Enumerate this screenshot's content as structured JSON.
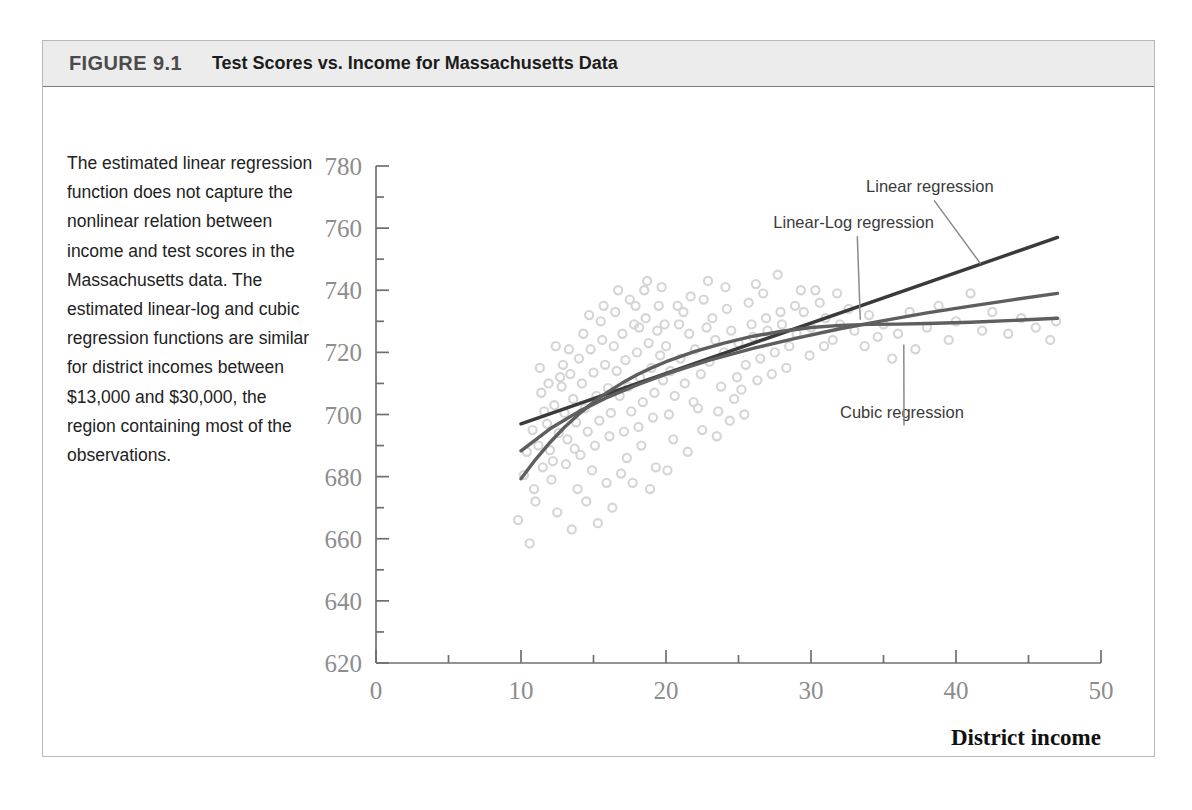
{
  "figure": {
    "number": "FIGURE 9.1",
    "title": "Test Scores vs. Income for Massachusetts Data",
    "caption": "The estimated linear regression function does not capture the nonlinear relation between income and test scores in the Massachusetts data. The estimated linear-log and cubic regression functions are similar for district incomes between $13,000 and $30,000, the region containing most of the observations."
  },
  "colors": {
    "header_band": "#ececec",
    "frame_border": "#b9b9b9",
    "scatter_point": "#d5d5d5",
    "linear_curve": "#3a3a3a",
    "linearlog_curve": "#5e5e5e",
    "cubic_curve": "#5e5e5e",
    "axis": "#6f6f6f",
    "tick_label": "#8d8d8d",
    "annotation": "#3a3a3a"
  },
  "chart_data": {
    "type": "scatter",
    "title": "Test Scores vs. Income for Massachusetts Data",
    "xlabel": "District income",
    "xlabel_sub": "(Thousands of dollars)",
    "ylabel": "",
    "xlim": [
      0,
      50
    ],
    "ylim": [
      620,
      780
    ],
    "grid": false,
    "legend_position": "annotations-on-plot",
    "xticks": [
      0,
      10,
      20,
      30,
      40,
      50
    ],
    "xtick_labels": [
      "0",
      "10",
      "20",
      "30",
      "40",
      "50"
    ],
    "xminor_ticks": [
      5,
      15,
      25,
      35,
      45
    ],
    "yticks": [
      620,
      640,
      660,
      680,
      700,
      720,
      740,
      760,
      780
    ],
    "ytick_labels": [
      "620",
      "640",
      "660",
      "680",
      "700",
      "720",
      "740",
      "760",
      "780"
    ],
    "yminor_ticks": [
      630,
      650,
      670,
      690,
      710,
      730,
      750,
      770
    ],
    "annotations": [
      {
        "label": "Linear regression",
        "text_x": 33.8,
        "text_y": 771.5,
        "tip_x": 41.7,
        "tip_y": 748.5
      },
      {
        "label": "Linear-Log regression",
        "text_x": 27.4,
        "text_y": 760.0,
        "tip_x": 33.4,
        "tip_y": 730.5
      },
      {
        "label": "Cubic regression",
        "text_x": 32.0,
        "text_y": 699.0,
        "tip_x": 36.4,
        "tip_y": 722.5
      }
    ],
    "series": [
      {
        "name": "Linear regression",
        "type": "line",
        "points": [
          [
            10.0,
            697.0
          ],
          [
            47.0,
            757.0
          ]
        ]
      },
      {
        "name": "Linear-Log regression",
        "type": "line",
        "points": [
          [
            10.0,
            688.3
          ],
          [
            12.0,
            695.4
          ],
          [
            14.0,
            701.0
          ],
          [
            16.0,
            705.6
          ],
          [
            18.0,
            709.5
          ],
          [
            20.0,
            713.0
          ],
          [
            23.0,
            717.5
          ],
          [
            26.0,
            721.3
          ],
          [
            29.0,
            724.6
          ],
          [
            32.0,
            727.6
          ],
          [
            35.0,
            730.2
          ],
          [
            38.0,
            732.7
          ],
          [
            41.0,
            734.9
          ],
          [
            44.0,
            737.0
          ],
          [
            47.0,
            739.0
          ]
        ]
      },
      {
        "name": "Cubic regression",
        "type": "line",
        "points": [
          [
            10.0,
            679.3
          ],
          [
            11.0,
            685.5
          ],
          [
            12.0,
            691.0
          ],
          [
            13.0,
            695.9
          ],
          [
            14.0,
            700.2
          ],
          [
            15.0,
            704.0
          ],
          [
            16.0,
            707.3
          ],
          [
            17.0,
            710.2
          ],
          [
            18.0,
            712.8
          ],
          [
            19.0,
            715.0
          ],
          [
            20.0,
            717.0
          ],
          [
            22.0,
            720.3
          ],
          [
            24.0,
            723.0
          ],
          [
            26.0,
            725.2
          ],
          [
            28.0,
            726.8
          ],
          [
            30.0,
            728.0
          ],
          [
            32.0,
            728.7
          ],
          [
            34.0,
            729.0
          ],
          [
            36.0,
            729.1
          ],
          [
            38.0,
            729.3
          ],
          [
            41.0,
            729.7
          ],
          [
            44.0,
            730.3
          ],
          [
            47.0,
            731.0
          ]
        ]
      }
    ],
    "scatter": {
      "name": "District observations",
      "marker": "open-circle",
      "points": [
        [
          9.8,
          666.0
        ],
        [
          10.6,
          658.5
        ],
        [
          10.2,
          680.5
        ],
        [
          10.9,
          676.0
        ],
        [
          11.2,
          690.0
        ],
        [
          11.5,
          683.0
        ],
        [
          11.0,
          672.0
        ],
        [
          11.8,
          697.0
        ],
        [
          12.0,
          688.5
        ],
        [
          12.3,
          703.0
        ],
        [
          12.6,
          694.0
        ],
        [
          12.1,
          679.0
        ],
        [
          12.8,
          709.0
        ],
        [
          13.0,
          700.5
        ],
        [
          13.2,
          692.0
        ],
        [
          13.4,
          713.0
        ],
        [
          13.6,
          705.0
        ],
        [
          13.8,
          697.5
        ],
        [
          13.1,
          684.0
        ],
        [
          14.0,
          718.0
        ],
        [
          14.2,
          710.0
        ],
        [
          14.4,
          702.0
        ],
        [
          14.6,
          694.5
        ],
        [
          14.8,
          721.0
        ],
        [
          14.1,
          687.0
        ],
        [
          15.0,
          713.5
        ],
        [
          15.2,
          706.0
        ],
        [
          15.4,
          698.0
        ],
        [
          15.6,
          724.0
        ],
        [
          15.8,
          716.0
        ],
        [
          15.1,
          690.0
        ],
        [
          15.5,
          730.0
        ],
        [
          16.0,
          708.5
        ],
        [
          16.2,
          700.5
        ],
        [
          16.4,
          722.0
        ],
        [
          16.6,
          714.0
        ],
        [
          16.8,
          706.0
        ],
        [
          16.1,
          693.0
        ],
        [
          16.5,
          733.0
        ],
        [
          17.0,
          726.0
        ],
        [
          17.2,
          717.5
        ],
        [
          17.4,
          709.0
        ],
        [
          17.6,
          701.0
        ],
        [
          17.8,
          729.0
        ],
        [
          17.1,
          694.5
        ],
        [
          17.5,
          737.0
        ],
        [
          18.0,
          720.0
        ],
        [
          18.2,
          712.0
        ],
        [
          18.4,
          704.0
        ],
        [
          18.6,
          731.0
        ],
        [
          18.8,
          723.0
        ],
        [
          18.1,
          696.0
        ],
        [
          18.5,
          740.0
        ],
        [
          19.0,
          715.0
        ],
        [
          19.2,
          707.0
        ],
        [
          19.4,
          727.0
        ],
        [
          19.6,
          719.0
        ],
        [
          19.8,
          711.0
        ],
        [
          19.1,
          699.0
        ],
        [
          19.5,
          735.0
        ],
        [
          20.0,
          722.0
        ],
        [
          20.3,
          714.0
        ],
        [
          20.6,
          706.0
        ],
        [
          20.9,
          729.0
        ],
        [
          20.2,
          700.0
        ],
        [
          21.0,
          718.0
        ],
        [
          21.3,
          710.0
        ],
        [
          21.6,
          726.0
        ],
        [
          21.9,
          704.0
        ],
        [
          21.2,
          733.0
        ],
        [
          22.0,
          721.0
        ],
        [
          22.4,
          713.0
        ],
        [
          22.8,
          728.0
        ],
        [
          22.2,
          702.0
        ],
        [
          22.6,
          737.0
        ],
        [
          23.0,
          717.0
        ],
        [
          23.4,
          724.0
        ],
        [
          23.8,
          709.0
        ],
        [
          23.2,
          731.0
        ],
        [
          23.6,
          701.0
        ],
        [
          24.0,
          720.0
        ],
        [
          24.5,
          727.0
        ],
        [
          24.9,
          712.0
        ],
        [
          24.2,
          734.0
        ],
        [
          24.7,
          705.0
        ],
        [
          25.0,
          723.0
        ],
        [
          25.5,
          716.0
        ],
        [
          25.9,
          729.0
        ],
        [
          25.2,
          708.0
        ],
        [
          25.7,
          736.0
        ],
        [
          26.0,
          725.0
        ],
        [
          26.5,
          718.0
        ],
        [
          26.9,
          731.0
        ],
        [
          26.3,
          711.0
        ],
        [
          26.7,
          739.0
        ],
        [
          27.0,
          727.0
        ],
        [
          27.5,
          720.0
        ],
        [
          27.9,
          733.0
        ],
        [
          27.3,
          713.0
        ],
        [
          28.0,
          729.0
        ],
        [
          28.5,
          722.0
        ],
        [
          28.9,
          735.0
        ],
        [
          28.3,
          715.0
        ],
        [
          29.0,
          726.0
        ],
        [
          29.5,
          733.0
        ],
        [
          29.9,
          719.0
        ],
        [
          29.3,
          740.0
        ],
        [
          30.0,
          728.0
        ],
        [
          30.6,
          736.0
        ],
        [
          30.9,
          722.0
        ],
        [
          31.0,
          731.0
        ],
        [
          31.5,
          724.0
        ],
        [
          31.8,
          739.0
        ],
        [
          32.0,
          729.0
        ],
        [
          32.6,
          734.0
        ],
        [
          33.0,
          727.0
        ],
        [
          33.7,
          722.0
        ],
        [
          34.0,
          732.0
        ],
        [
          34.6,
          725.0
        ],
        [
          35.0,
          729.0
        ],
        [
          35.6,
          718.0
        ],
        [
          36.0,
          726.0
        ],
        [
          36.8,
          733.0
        ],
        [
          37.2,
          721.0
        ],
        [
          38.0,
          728.0
        ],
        [
          38.8,
          735.0
        ],
        [
          39.5,
          724.0
        ],
        [
          40.0,
          730.0
        ],
        [
          41.0,
          739.0
        ],
        [
          41.8,
          727.0
        ],
        [
          42.5,
          733.0
        ],
        [
          43.6,
          726.0
        ],
        [
          44.5,
          731.0
        ],
        [
          45.5,
          728.0
        ],
        [
          46.5,
          724.0
        ],
        [
          46.9,
          730.0
        ],
        [
          12.5,
          668.5
        ],
        [
          13.5,
          663.0
        ],
        [
          14.5,
          672.0
        ],
        [
          13.9,
          676.0
        ],
        [
          15.3,
          665.0
        ],
        [
          16.3,
          670.0
        ],
        [
          12.2,
          685.0
        ],
        [
          11.6,
          701.0
        ],
        [
          17.3,
          686.0
        ],
        [
          18.3,
          690.0
        ],
        [
          19.3,
          683.0
        ],
        [
          20.5,
          692.0
        ],
        [
          21.5,
          688.0
        ],
        [
          22.5,
          695.0
        ],
        [
          16.9,
          681.0
        ],
        [
          15.9,
          678.0
        ],
        [
          14.9,
          682.0
        ],
        [
          13.7,
          689.0
        ],
        [
          17.7,
          678.0
        ],
        [
          18.9,
          676.0
        ],
        [
          20.1,
          682.0
        ],
        [
          23.5,
          693.0
        ],
        [
          24.4,
          698.0
        ],
        [
          25.4,
          700.0
        ],
        [
          11.4,
          707.0
        ],
        [
          12.9,
          716.0
        ],
        [
          14.3,
          726.0
        ],
        [
          15.7,
          735.0
        ],
        [
          16.7,
          740.0
        ],
        [
          18.7,
          743.0
        ],
        [
          19.7,
          741.0
        ],
        [
          21.7,
          738.0
        ],
        [
          13.3,
          721.0
        ],
        [
          12.7,
          712.0
        ],
        [
          11.9,
          710.0
        ],
        [
          22.9,
          743.0
        ],
        [
          26.2,
          742.0
        ],
        [
          30.3,
          740.0
        ],
        [
          27.7,
          745.0
        ],
        [
          10.4,
          688.0
        ],
        [
          10.8,
          695.0
        ],
        [
          11.3,
          715.0
        ],
        [
          12.4,
          722.0
        ],
        [
          14.7,
          732.0
        ],
        [
          17.9,
          735.0
        ],
        [
          20.8,
          735.0
        ],
        [
          24.1,
          741.0
        ],
        [
          19.9,
          729.0
        ],
        [
          18.15,
          728.0
        ]
      ]
    }
  }
}
